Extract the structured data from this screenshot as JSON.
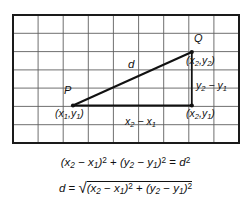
{
  "figure": {
    "grid": {
      "columns": 9,
      "rows": 7,
      "left": 13,
      "top": 15,
      "right": 239,
      "bottom": 143,
      "line_color": "#5a5a5a",
      "border_color": "#1a1a1a"
    },
    "points": {
      "P": {
        "label": "P",
        "coord": "(x₁,y₁)",
        "x": 73,
        "y": 105
      },
      "Q": {
        "label": "Q",
        "coord": "(x₂,y₂)",
        "x": 192,
        "y": 52
      },
      "R": {
        "label": "",
        "coord": "(x₂,y₁)",
        "x": 192,
        "y": 105
      }
    },
    "segments": {
      "hypotenuse_label": "d",
      "horizontal_label": "x₂ − x₁",
      "vertical_label": "y₂ − y₁"
    },
    "line_color": "#111111"
  },
  "equations": {
    "line1": {
      "lhs_a_open": "(",
      "x2": "x",
      "x2sub": "2",
      "minus1": " − ",
      "x1": "x",
      "x1sub": "1",
      "close_sq1": ")",
      "exp1": "2",
      "plus": " + ",
      "open2": "(",
      "y2": "y",
      "y2sub": "2",
      "minus2": " − ",
      "y1": "y",
      "y1sub": "1",
      "close_sq2": ")",
      "exp2": "2",
      "equals": " = ",
      "d": "d",
      "dexp": "2"
    },
    "line2": {
      "d": "d",
      "equals": " = ",
      "radical": "√",
      "open1": "(",
      "x2": "x",
      "x2sub": "2",
      "minus1": " − ",
      "x1": "x",
      "x1sub": "1",
      "close1": ")",
      "exp1": "2",
      "plus": " + ",
      "open2": "(",
      "y2": "y",
      "y2sub": "2",
      "minus2": " − ",
      "y1": "y",
      "y1sub": "1",
      "close2": ")",
      "exp2": "2"
    }
  }
}
